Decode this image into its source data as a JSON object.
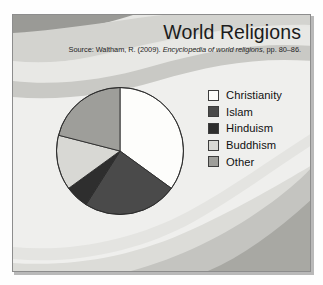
{
  "slide": {
    "title": "World Religions",
    "source_prefix": "Source: Waltham, R. (2009). ",
    "source_italic": "Encyclopedia of world religions",
    "source_suffix": ", pp. 80–86.",
    "background_colors": {
      "base": "#efefed",
      "wave_light": "#e3e3e0",
      "wave_mid": "#cfcfcb",
      "wave_dark": "#b0b0ab",
      "wave_darkest": "#9a9a96"
    },
    "frame_border": "#8d8d8d"
  },
  "chart_data": {
    "type": "pie",
    "title": "World Religions",
    "categories": [
      "Christianity",
      "Islam",
      "Hinduism",
      "Buddhism",
      "Other"
    ],
    "values": [
      35,
      24,
      6,
      14,
      21
    ],
    "colors": [
      "#fdfdfb",
      "#4a4a4a",
      "#2e2e2e",
      "#d8d8d4",
      "#9e9e9a"
    ],
    "start_angle": 0,
    "direction": "clockwise",
    "outline_color": "#2b2b2b",
    "legend_position": "right",
    "labels_shown": false
  },
  "legend": {
    "items": [
      {
        "label": "Christianity",
        "color": "#fdfdfb"
      },
      {
        "label": "Islam",
        "color": "#4a4a4a"
      },
      {
        "label": "Hinduism",
        "color": "#2e2e2e"
      },
      {
        "label": "Buddhism",
        "color": "#d8d8d4"
      },
      {
        "label": "Other",
        "color": "#9e9e9a"
      }
    ]
  }
}
